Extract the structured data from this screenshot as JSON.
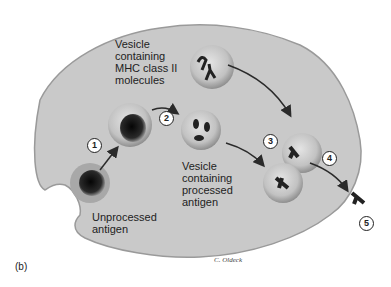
{
  "figure": {
    "panel_label": "(b)",
    "labels": {
      "mhc_vesicle": [
        "Vesicle",
        "containing",
        "MHC class II",
        "molecules"
      ],
      "processed_vesicle": [
        "Vesicle",
        "containing",
        "processed",
        "antigen"
      ],
      "unprocessed": [
        "Unprocessed",
        "antigen"
      ]
    },
    "steps": [
      "1",
      "2",
      "3",
      "4",
      "5"
    ],
    "signature": "C. Oldeck",
    "colors": {
      "cell_fill": "#c9c9c9",
      "cell_edge": "#9a9a9a",
      "vesicle_fill": "#bdbdbd",
      "dark": "#1a1a1a",
      "arrow": "#2a2a2a"
    }
  }
}
